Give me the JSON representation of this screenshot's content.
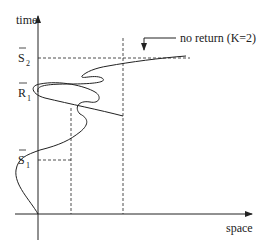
{
  "diagram": {
    "axes": {
      "y_label": "time",
      "x_label": "space"
    },
    "time_marks": [
      {
        "symbol": "S",
        "subscript": "2",
        "overbar": true
      },
      {
        "symbol": "R",
        "subscript": "1",
        "overbar": true
      },
      {
        "symbol": "S",
        "subscript": "1",
        "overbar": true
      }
    ],
    "annotation": "no return (K=2)",
    "colors": {
      "ink": "#222222",
      "background": "#ffffff"
    }
  }
}
